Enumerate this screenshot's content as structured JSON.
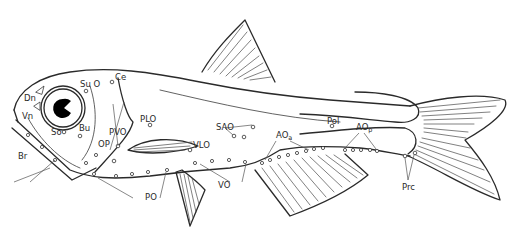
{
  "figure": {
    "colors": {
      "line": "#2a2a2a",
      "background": "#ffffff",
      "eye_pupil": "#000000"
    }
  },
  "labels": {
    "Dn": "Dn",
    "Vn": "Vn",
    "Br": "Br",
    "SuO": "Su O",
    "Ce": "Ce",
    "So": "So",
    "Bu": "Bu",
    "OP": "OP",
    "PVO": "PVO",
    "PLO": "PLO",
    "VLO": "VLO",
    "SAO": "SAO",
    "VO": "VO",
    "PO": "PO",
    "AOa_main": "AO",
    "AOa_sub": "a",
    "Pol": "Pol",
    "AOp_main": "AO",
    "AOp_sub": "p",
    "Prc": "Prc"
  }
}
